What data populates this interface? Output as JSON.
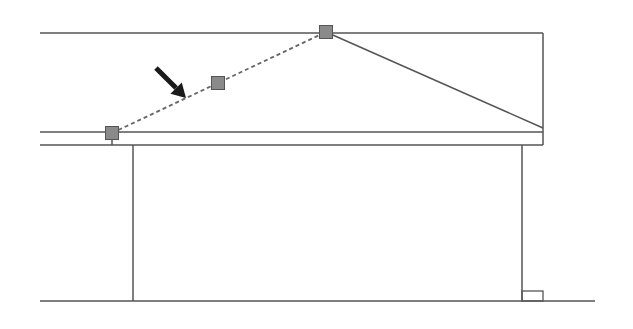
{
  "diagram": {
    "type": "building-elevation-roof-edit",
    "colors": {
      "background": "#ffffff",
      "line": "#555555",
      "dashed_line": "#666666",
      "handle_fill": "#8a8a8a",
      "handle_stroke": "#555555",
      "arrow": "#1a1a1a"
    },
    "lines": [
      {
        "name": "roof-top-line",
        "x1": 40,
        "y1": 33,
        "x2": 543,
        "y2": 33
      },
      {
        "name": "roof-right-edge",
        "x1": 543,
        "y1": 33,
        "x2": 543,
        "y2": 145
      },
      {
        "name": "eave-line-upper",
        "x1": 40,
        "y1": 132,
        "x2": 543,
        "y2": 132
      },
      {
        "name": "eave-line-lower",
        "x1": 40,
        "y1": 145,
        "x2": 543,
        "y2": 145
      },
      {
        "name": "left-wall",
        "x1": 133,
        "y1": 145,
        "x2": 133,
        "y2": 301
      },
      {
        "name": "right-wall",
        "x1": 522,
        "y1": 145,
        "x2": 522,
        "y2": 301
      },
      {
        "name": "ground-line",
        "x1": 40,
        "y1": 301,
        "x2": 595,
        "y2": 301
      },
      {
        "name": "handle-stem",
        "x1": 112,
        "y1": 133,
        "x2": 112,
        "y2": 145
      },
      {
        "name": "roof-slope-right",
        "x1": 326,
        "y1": 32,
        "x2": 543,
        "y2": 128
      }
    ],
    "dashed_lines": [
      {
        "name": "roof-slope-left-dashed",
        "x1": 112,
        "y1": 133,
        "x2": 326,
        "y2": 32
      }
    ],
    "rects": [
      {
        "name": "base-step-rect",
        "x": 522,
        "y": 291,
        "w": 21,
        "h": 10
      }
    ],
    "handles": [
      {
        "name": "handle-start",
        "cx": 112,
        "cy": 133,
        "size": 13
      },
      {
        "name": "handle-mid",
        "cx": 218,
        "cy": 83,
        "size": 13
      },
      {
        "name": "handle-peak",
        "cx": 326,
        "cy": 32,
        "size": 13
      }
    ],
    "arrow": {
      "name": "pointer-arrow",
      "x1": 156,
      "y1": 68,
      "x2": 186,
      "y2": 98
    }
  }
}
